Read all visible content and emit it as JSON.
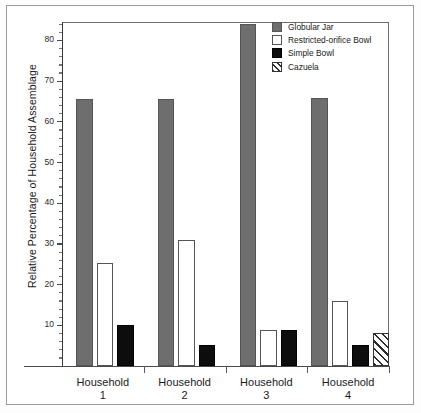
{
  "chart_data": {
    "type": "bar",
    "title": "",
    "xlabel": "",
    "ylabel": "Relative Percentage of Household Assemblage",
    "categories": [
      "Household 1",
      "Household 2",
      "Household 3",
      "Household 4"
    ],
    "category_lines": [
      {
        "name": "Household",
        "num": "1"
      },
      {
        "name": "Household",
        "num": "2"
      },
      {
        "name": "Household",
        "num": "3"
      },
      {
        "name": "Household",
        "num": "4"
      }
    ],
    "series": [
      {
        "name": "Globular Jar",
        "fill": "solid-gray",
        "color": "#6e6e6e",
        "values": [
          65.5,
          65.6,
          84.0,
          65.8
        ]
      },
      {
        "name": "Restricted-orifice Bowl",
        "fill": "white",
        "color": "#ffffff",
        "values": [
          25.3,
          31.0,
          8.8,
          16.0
        ]
      },
      {
        "name": "Simple Bowl",
        "fill": "solid-black",
        "color": "#0d0d0d",
        "values": [
          10.0,
          5.2,
          8.8,
          5.2
        ]
      },
      {
        "name": "Cazuela",
        "fill": "hatched",
        "color": "#ffffff",
        "values": [
          null,
          null,
          null,
          8.2
        ]
      }
    ],
    "ylim": [
      0,
      86
    ],
    "ytick_labels": [
      "10",
      "20",
      "30",
      "40",
      "50",
      "60",
      "70",
      "80"
    ],
    "ytick_values": [
      10,
      20,
      30,
      40,
      50,
      60,
      70,
      80
    ],
    "yminor_step": 2,
    "grid": false,
    "legend_position": "top-right"
  },
  "legend": {
    "items": [
      {
        "label": "Globular Jar"
      },
      {
        "label": "Restricted-orifice Bowl"
      },
      {
        "label": "Simple Bowl"
      },
      {
        "label": "Cazuela"
      }
    ]
  }
}
